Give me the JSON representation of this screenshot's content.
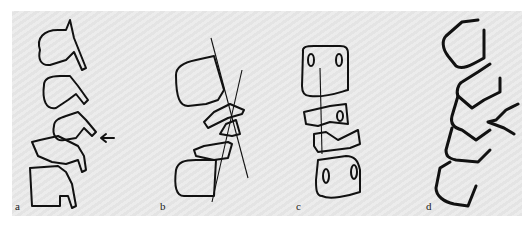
{
  "figure": {
    "panels": [
      {
        "id": "a",
        "label": "a",
        "description": "Lateral spine drawing with arrow indicating level"
      },
      {
        "id": "b",
        "label": "b",
        "description": "Lateral drawing with two intersecting reference lines"
      },
      {
        "id": "c",
        "label": "c",
        "description": "Frontal view of vertebral bodies with midline"
      },
      {
        "id": "d",
        "label": "d",
        "description": "Lateral outline drawing with bold strokes"
      }
    ]
  }
}
